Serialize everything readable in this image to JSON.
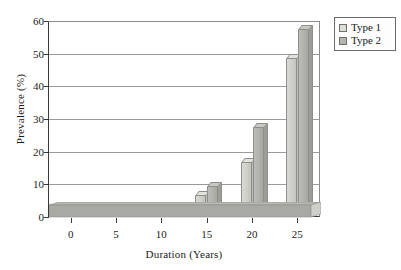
{
  "chart_data": {
    "type": "bar",
    "title": "",
    "subtitle": "",
    "xlabel": "Duration (Years)",
    "ylabel": "Prevalence (%)",
    "categories": [
      "0",
      "5",
      "10",
      "15",
      "20",
      "25"
    ],
    "xtick_labels": [
      "0",
      "5",
      "10",
      "15",
      "20",
      "25"
    ],
    "ytick_labels": [
      "0",
      "10",
      "20",
      "30",
      "40",
      "50",
      "60"
    ],
    "ytick_values": [
      0,
      10,
      20,
      30,
      40,
      50,
      60
    ],
    "ylim": [
      0,
      60
    ],
    "grid": "horizontal",
    "legend_position": "outside-top-right",
    "style": "3d-grouped-columns",
    "series": [
      {
        "name": "Type 1",
        "color": "#d4d4cf",
        "values": [
          0.2,
          0.3,
          1.3,
          6.8,
          16.8,
          48.8
        ]
      },
      {
        "name": "Type 2",
        "color": "#b2b2ad",
        "values": [
          0.2,
          0.3,
          1.9,
          9.5,
          27.4,
          57.6
        ]
      }
    ],
    "annotations": []
  },
  "legend": {
    "items": [
      {
        "label": "Type 1",
        "swatch": "legend-swatch-type-1"
      },
      {
        "label": "Type 2",
        "swatch": "legend-swatch-type-2"
      }
    ]
  },
  "colors": {
    "series_1": "#d4d4cf",
    "series_2": "#b2b2ad",
    "floor": "#a9a9a4",
    "gridline": "#9a9a9a",
    "axis": "#3a3a3a",
    "background": "#ffffff"
  }
}
